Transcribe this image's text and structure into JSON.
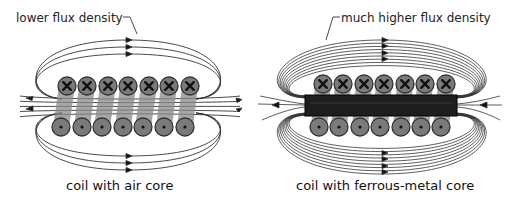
{
  "left_panel": {
    "annotation": "lower flux density",
    "caption": "coil with air core",
    "top_wires": 7,
    "bottom_wires": 7,
    "top_wire_symbol": "cross (current into page)",
    "bottom_wire_symbol": "dot (current out of page)",
    "core": "air"
  },
  "right_panel": {
    "annotation": "much higher flux density",
    "caption": "coil with ferrous-metal core",
    "top_wires": 7,
    "bottom_wires": 7,
    "top_wire_symbol": "cross (current into page)",
    "bottom_wire_symbol": "dot (current out of page)",
    "core": "ferrous metal"
  },
  "colors": {
    "wire_fill": "#7a7a7a",
    "wire_stroke": "#333333",
    "core_fill": "#1e1e1e",
    "flux_line": "#333333",
    "background": "#ffffff"
  }
}
